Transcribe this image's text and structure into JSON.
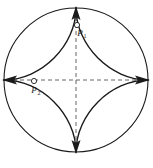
{
  "figure": {
    "canvas": {
      "width": 153,
      "height": 168,
      "background": "#ffffff"
    },
    "colors": {
      "stroke": "#1a1a1a",
      "dashed": "#555555",
      "background": "#ffffff",
      "marker_fill": "#ffffff"
    },
    "circle": {
      "name": "outer-circle",
      "cx": 76,
      "cy": 80,
      "r": 72,
      "stroke_width": 1.1
    },
    "astroid": {
      "name": "astroid-curve",
      "cx": 76,
      "cy": 80,
      "a": 72,
      "stroke_width": 1.4,
      "cusps": [
        {
          "name": "top-cusp",
          "x": 76,
          "y": 8
        },
        {
          "name": "right-cusp",
          "x": 148,
          "y": 80
        },
        {
          "name": "bottom-cusp",
          "x": 76,
          "y": 152
        },
        {
          "name": "left-cusp",
          "x": 4,
          "y": 80
        }
      ]
    },
    "axes": [
      {
        "name": "horizontal-axis",
        "x1": 4,
        "y1": 80,
        "x2": 148,
        "y2": 80,
        "dash": "4,3"
      },
      {
        "name": "vertical-axis",
        "x1": 76,
        "y1": 8,
        "x2": 76,
        "y2": 152,
        "dash": "4,3"
      }
    ],
    "arrowheads": [
      {
        "name": "arrowhead-top",
        "x": 76,
        "y": 8,
        "direction": "up"
      },
      {
        "name": "arrowhead-right",
        "x": 148,
        "y": 80,
        "direction": "right"
      },
      {
        "name": "arrowhead-bottom",
        "x": 76,
        "y": 152,
        "direction": "down"
      },
      {
        "name": "arrowhead-left",
        "x": 4,
        "y": 80,
        "direction": "left"
      }
    ],
    "annotations": [
      {
        "name": "annotation-top",
        "marker": {
          "x": 77,
          "y": 25,
          "r": 2.6
        },
        "label": "P",
        "subscript": "1",
        "label_x": 80,
        "label_y": 36
      },
      {
        "name": "annotation-left",
        "marker": {
          "x": 34,
          "y": 81,
          "r": 2.6
        },
        "label": "P",
        "subscript": "2",
        "label_x": 33,
        "label_y": 93
      }
    ]
  }
}
